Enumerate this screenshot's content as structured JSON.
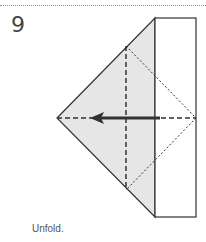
{
  "step": {
    "number": "9"
  },
  "caption": "Unfold.",
  "colors": {
    "outline": "#333333",
    "shaded_fill": "#e6e6e6",
    "paper_fill": "#ffffff",
    "arrow": "#333333",
    "rule": "#8a8a8a"
  },
  "diagram": {
    "elements": [
      "shaded-triangle",
      "white-rectangle-flap",
      "vertical-dashed-valley-line",
      "horizontal-dashed-valley-line",
      "dotted-diamond-crease-lines",
      "unfold-arrow-left"
    ]
  }
}
